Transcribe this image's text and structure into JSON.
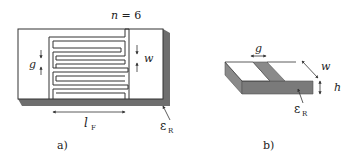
{
  "panel_a": {
    "caption": "a)",
    "n_label": "n = 6",
    "gap_label": "g",
    "width_label": "w",
    "length_label": "l",
    "length_subscript": "F",
    "permittivity_label": "ε",
    "permittivity_subscript": "R"
  },
  "panel_b": {
    "caption": "b)",
    "gap_label": "g",
    "width_label": "w",
    "height_label": "h",
    "permittivity_label": "ε",
    "permittivity_subscript": "R"
  },
  "colors": {
    "substrate_top": "#ffffff",
    "substrate_side": "#6e6e6e",
    "conductor_outline": "#333333",
    "shaded": "#8a8a8a"
  }
}
